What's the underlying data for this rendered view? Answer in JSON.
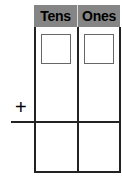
{
  "columns": [
    {
      "label": "Tens"
    },
    {
      "label": "Ones"
    }
  ],
  "operator": "+",
  "colors": {
    "header_bg": "#858585",
    "line": "#222222",
    "box_border": "#666666"
  }
}
